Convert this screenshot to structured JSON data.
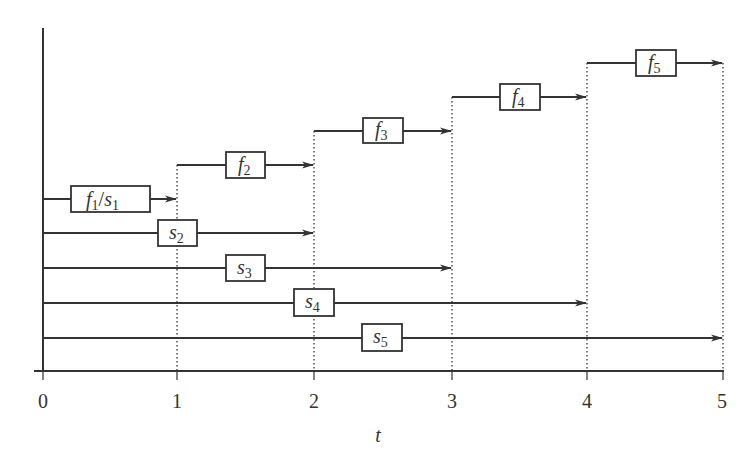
{
  "diagram": {
    "x_axis": {
      "label": "t",
      "ticks": [
        "0",
        "1",
        "2",
        "3",
        "4",
        "5"
      ]
    },
    "colors": {
      "line": "#333333",
      "box_fill": "#ffffff",
      "background": "#ffffff"
    },
    "arrows": [
      {
        "id": "f1s1",
        "label_main": "f",
        "label_sub": "1",
        "label_sep": "/",
        "label_main2": "s",
        "label_sub2": "1",
        "start": 0,
        "end": 1
      },
      {
        "id": "f2",
        "label_main": "f",
        "label_sub": "2",
        "start": 1,
        "end": 2
      },
      {
        "id": "f3",
        "label_main": "f",
        "label_sub": "3",
        "start": 2,
        "end": 3
      },
      {
        "id": "f4",
        "label_main": "f",
        "label_sub": "4",
        "start": 3,
        "end": 4
      },
      {
        "id": "f5",
        "label_main": "f",
        "label_sub": "5",
        "start": 4,
        "end": 5
      },
      {
        "id": "s2",
        "label_main": "s",
        "label_sub": "2",
        "start": 0,
        "end": 2
      },
      {
        "id": "s3",
        "label_main": "s",
        "label_sub": "3",
        "start": 0,
        "end": 3
      },
      {
        "id": "s4",
        "label_main": "s",
        "label_sub": "4",
        "start": 0,
        "end": 4
      },
      {
        "id": "s5",
        "label_main": "s",
        "label_sub": "5",
        "start": 0,
        "end": 5
      }
    ]
  }
}
